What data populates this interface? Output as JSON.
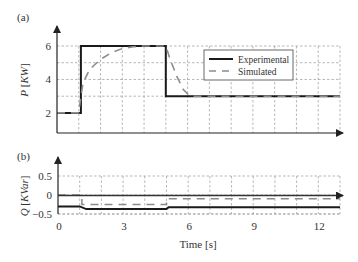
{
  "chart_data": [
    {
      "panel_label": "(a)",
      "type": "line",
      "title": "",
      "xlabel": "",
      "ylabel": "P [KW]",
      "ylabel_parts": {
        "var": "P",
        "unit_open": "[",
        "unit": "KW",
        "unit_close": "]"
      },
      "xlim": [
        0,
        13
      ],
      "ylim": [
        0.8,
        6
      ],
      "yticks": [
        2,
        4,
        6
      ],
      "ygrid": [
        3,
        4,
        5,
        6
      ],
      "xgrid": [
        1,
        2,
        3,
        4,
        5,
        6,
        7,
        8,
        9,
        10,
        11,
        12,
        13
      ],
      "grid": true,
      "legend": {
        "position": "upper right (inside)",
        "entries": [
          "Experimental",
          "Simulated"
        ]
      },
      "series": [
        {
          "name": "Experimental",
          "style": "solid",
          "color": "#1a1a1a",
          "x": [
            0,
            1.1,
            1.1,
            5.0,
            5.0,
            13
          ],
          "y": [
            2.0,
            2.0,
            6.0,
            6.0,
            3.0,
            3.0
          ]
        },
        {
          "name": "Simulated",
          "style": "dashed",
          "color": "#8c8c8c",
          "x": [
            0,
            1.0,
            1.1,
            1.2,
            1.5,
            2.0,
            2.5,
            3.0,
            3.5,
            4.0,
            5.0,
            5.2,
            5.5,
            5.8,
            6.1,
            6.5,
            13
          ],
          "y": [
            2.0,
            2.0,
            3.0,
            3.8,
            4.6,
            5.2,
            5.6,
            5.85,
            5.95,
            6.0,
            6.0,
            5.2,
            4.2,
            3.4,
            3.0,
            3.0,
            3.0
          ]
        }
      ]
    },
    {
      "panel_label": "(b)",
      "type": "line",
      "title": "",
      "xlabel": "Time [s]",
      "ylabel": "Q [KVar]",
      "ylabel_parts": {
        "var": "Q",
        "unit_open": "[",
        "unit": "KVar",
        "unit_close": "]"
      },
      "xlim": [
        0,
        13
      ],
      "ylim": [
        -0.5,
        0.5
      ],
      "yticks": [
        0.5,
        0,
        -0.5
      ],
      "ytick_labels": [
        "0.5",
        "0",
        "−0.5"
      ],
      "xticks": [
        0,
        3,
        6,
        9,
        12
      ],
      "xtick_labels": [
        "0",
        "3",
        "6",
        "9",
        "12"
      ],
      "xgrid": [
        1,
        2,
        3,
        4,
        5,
        6,
        7,
        8,
        9,
        10,
        11,
        12,
        13
      ],
      "grid": true,
      "series": [
        {
          "name": "Experimental",
          "style": "solid",
          "color": "#1a1a1a",
          "x": [
            0,
            1.0,
            1.3,
            5.0,
            5.1,
            13
          ],
          "y": [
            -0.3,
            -0.3,
            -0.37,
            -0.37,
            -0.32,
            -0.32
          ]
        },
        {
          "name": "Simulated",
          "style": "dashed",
          "color": "#8c8c8c",
          "x": [
            0,
            1.1,
            1.1,
            5.0,
            5.0,
            13
          ],
          "y": [
            0.0,
            0.0,
            -0.25,
            -0.25,
            -0.1,
            -0.1
          ]
        }
      ]
    }
  ]
}
